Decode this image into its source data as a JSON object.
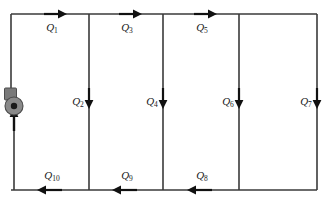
{
  "figure": {
    "kind": "pipe-network-diagram",
    "title": "",
    "background_color": "#ffffff",
    "line_color": "#3a3a3a",
    "arrow_color": "#111111",
    "label_color": "#1a1a1a",
    "pump_color": "#8a8a8a",
    "pump_hub_color": "#1b1b1b"
  },
  "geometry": {
    "width": 329,
    "height": 201,
    "top_rail_y": 14,
    "bottom_rail_y": 190,
    "node_x": [
      11,
      89,
      163,
      239,
      317
    ]
  },
  "components": [
    {
      "name": "pump",
      "symbol": "centrifugal-pump",
      "x": 14,
      "y": 106,
      "radius": 8.5
    }
  ],
  "flows": [
    {
      "id": "Q1",
      "label": "Q",
      "sub": "1",
      "segment": "top",
      "x": 52,
      "y": 14,
      "label_x": 52,
      "label_y": 28,
      "direction": "right"
    },
    {
      "id": "Q3",
      "label": "Q",
      "sub": "3",
      "segment": "top",
      "x": 127,
      "y": 14,
      "label_x": 127,
      "label_y": 28,
      "direction": "right"
    },
    {
      "id": "Q5",
      "label": "Q",
      "sub": "5",
      "segment": "top",
      "x": 202,
      "y": 14,
      "label_x": 202,
      "label_y": 28,
      "direction": "right"
    },
    {
      "id": "Q2",
      "label": "Q",
      "sub": "2",
      "segment": "branch",
      "x": 89,
      "y": 103,
      "label_x": 78,
      "label_y": 102,
      "direction": "down"
    },
    {
      "id": "Q4",
      "label": "Q",
      "sub": "4",
      "segment": "branch",
      "x": 163,
      "y": 103,
      "label_x": 152,
      "label_y": 102,
      "direction": "down"
    },
    {
      "id": "Q6",
      "label": "Q",
      "sub": "6",
      "segment": "branch",
      "x": 239,
      "y": 103,
      "label_x": 228,
      "label_y": 102,
      "direction": "down"
    },
    {
      "id": "Q7",
      "label": "Q",
      "sub": "7",
      "segment": "branch",
      "x": 317,
      "y": 103,
      "label_x": 306,
      "label_y": 102,
      "direction": "down"
    },
    {
      "id": "Q10",
      "label": "Q",
      "sub": "10",
      "segment": "bottom",
      "x": 52,
      "y": 190,
      "label_x": 52,
      "label_y": 176,
      "direction": "left"
    },
    {
      "id": "Q9",
      "label": "Q",
      "sub": "9",
      "segment": "bottom",
      "x": 127,
      "y": 190,
      "label_x": 127,
      "label_y": 176,
      "direction": "left"
    },
    {
      "id": "Q8",
      "label": "Q",
      "sub": "8",
      "segment": "bottom",
      "x": 202,
      "y": 190,
      "label_x": 202,
      "label_y": 176,
      "direction": "left"
    },
    {
      "id": "Qpump",
      "label": "",
      "sub": "",
      "segment": "left",
      "x": 14,
      "y": 124,
      "label_x": 0,
      "label_y": 0,
      "direction": "up"
    }
  ]
}
